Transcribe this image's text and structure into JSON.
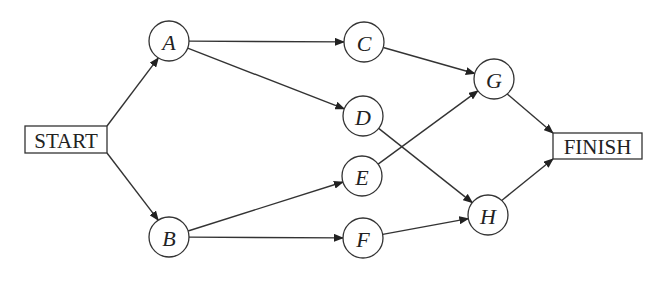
{
  "diagram": {
    "type": "activity-network",
    "start": {
      "id": "START",
      "label": "START",
      "x": 25,
      "y": 126,
      "w": 82,
      "h": 27
    },
    "finish": {
      "id": "FINISH",
      "label": "FINISH",
      "x": 553,
      "y": 133,
      "w": 89,
      "h": 26
    },
    "node_radius": 20,
    "nodes": [
      {
        "id": "A",
        "label": "A",
        "cx": 169,
        "cy": 41
      },
      {
        "id": "B",
        "label": "B",
        "cx": 169,
        "cy": 237
      },
      {
        "id": "C",
        "label": "C",
        "cx": 364,
        "cy": 42
      },
      {
        "id": "D",
        "label": "D",
        "cx": 363,
        "cy": 116
      },
      {
        "id": "E",
        "label": "E",
        "cx": 362,
        "cy": 176
      },
      {
        "id": "F",
        "label": "F",
        "cx": 363,
        "cy": 238
      },
      {
        "id": "G",
        "label": "G",
        "cx": 494,
        "cy": 79
      },
      {
        "id": "H",
        "label": "H",
        "cx": 488,
        "cy": 215
      }
    ],
    "edges": [
      {
        "from": "START",
        "to": "A"
      },
      {
        "from": "START",
        "to": "B"
      },
      {
        "from": "A",
        "to": "C"
      },
      {
        "from": "A",
        "to": "D"
      },
      {
        "from": "B",
        "to": "E"
      },
      {
        "from": "B",
        "to": "F"
      },
      {
        "from": "C",
        "to": "G"
      },
      {
        "from": "D",
        "to": "H"
      },
      {
        "from": "E",
        "to": "G"
      },
      {
        "from": "F",
        "to": "H"
      },
      {
        "from": "G",
        "to": "FINISH"
      },
      {
        "from": "H",
        "to": "FINISH"
      }
    ],
    "colors": {
      "stroke": "#333333",
      "text": "#222222",
      "background": "#ffffff"
    }
  }
}
